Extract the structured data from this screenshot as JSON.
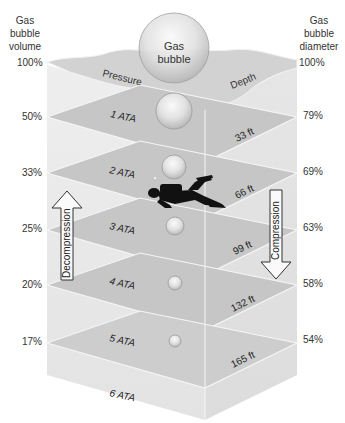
{
  "left_header": [
    "Gas",
    "bubble",
    "volume"
  ],
  "right_header": [
    "Gas",
    "bubble",
    "diameter"
  ],
  "bubble_label": [
    "Gas",
    "bubble"
  ],
  "surface_labels": {
    "left": "Pressure",
    "right": "Depth"
  },
  "arrows": {
    "up": "Decompression",
    "down": "Compression"
  },
  "levels": [
    {
      "ata": "",
      "depth": "",
      "volume": "100%",
      "diameter": "100%"
    },
    {
      "ata": "1 ATA",
      "depth": "33 ft",
      "volume": "50%",
      "diameter": "79%"
    },
    {
      "ata": "2 ATA",
      "depth": "66 ft",
      "volume": "33%",
      "diameter": "69%"
    },
    {
      "ata": "3 ATA",
      "depth": "99 ft",
      "volume": "25%",
      "diameter": "63%"
    },
    {
      "ata": "4 ATA",
      "depth": "132 ft",
      "volume": "20%",
      "diameter": "58%"
    },
    {
      "ata": "5 ATA",
      "depth": "165 ft",
      "volume": "17%",
      "diameter": "54%"
    },
    {
      "ata": "6 ATA",
      "depth": "",
      "volume": "",
      "diameter": ""
    }
  ],
  "colors": {
    "plane": "#c4c4c4",
    "plane_edge": "#f4f4f4",
    "box_face": "#e6e6e6",
    "water_surface": "#d0d0d0",
    "diver": "#111111"
  }
}
